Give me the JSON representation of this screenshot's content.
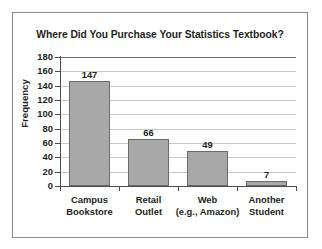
{
  "chart_data": {
    "type": "bar",
    "title": "Where Did You Purchase Your Statistics Textbook?",
    "xlabel": "",
    "ylabel": "Frequency",
    "categories": [
      "Campus\nBookstore",
      "Retail\nOutlet",
      "Web\n(e.g., Amazon)",
      "Another\nStudent"
    ],
    "category_lines": [
      [
        "Campus",
        "Bookstore"
      ],
      [
        "Retail",
        "Outlet"
      ],
      [
        "Web",
        "(e.g., Amazon)"
      ],
      [
        "Another",
        "Student"
      ]
    ],
    "values": [
      147,
      66,
      49,
      7
    ],
    "value_labels": [
      "147",
      "66",
      "49",
      "7"
    ],
    "ylim": [
      0,
      180
    ],
    "ytick_labels": [
      "180",
      "160",
      "140",
      "120",
      "100",
      "80",
      "60",
      "40",
      "20",
      "0"
    ],
    "ytick_values": [
      180,
      160,
      140,
      120,
      100,
      80,
      60,
      40,
      20,
      0
    ],
    "grid": true,
    "legend": false,
    "colors": {
      "bar_fill": "#a8a8a8",
      "bar_stroke": "#6a6a6a",
      "gridline": "#c9c9c9",
      "axis": "#4d4d4d",
      "frame": "#8c8c8c",
      "text": "#231f20",
      "background": "#ffffff"
    }
  }
}
